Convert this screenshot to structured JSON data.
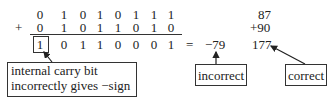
{
  "addition": {
    "operator": "+",
    "row1": [
      "0",
      "1",
      "0",
      "1",
      "0",
      "1",
      "1",
      "1"
    ],
    "row2": [
      "0",
      "1",
      "0",
      "1",
      "1",
      "0",
      "1",
      "0"
    ],
    "result": [
      "1",
      "0",
      "1",
      "1",
      "0",
      "0",
      "0",
      "1"
    ],
    "equals": "=",
    "signed_result": "−79"
  },
  "decimal": {
    "a": "87",
    "b": "+90",
    "sum": "177"
  },
  "annotations": {
    "carry_line1": "internal carry bit",
    "carry_line2": "incorrectly gives −sign",
    "incorrect": "incorrect",
    "correct": "correct"
  }
}
